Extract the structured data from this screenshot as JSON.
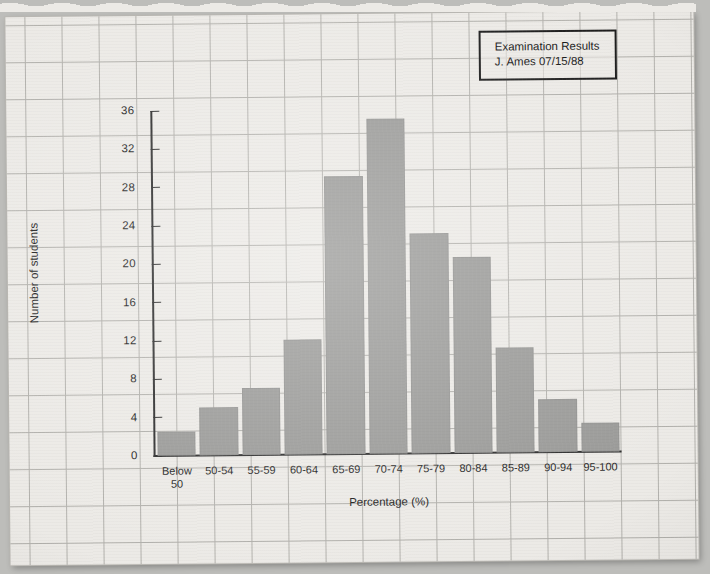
{
  "annotation": {
    "title": "Examination Results",
    "byline": "J. Ames 07/15/88"
  },
  "chart_data": {
    "type": "bar",
    "title": "Examination Results",
    "subtitle": "J. Ames 07/15/88",
    "xlabel": "Percentage (%)",
    "ylabel": "Number of students",
    "categories": [
      "Below 50",
      "50-54",
      "55-59",
      "60-64",
      "65-69",
      "70-74",
      "75-79",
      "80-84",
      "85-89",
      "90-94",
      "95-100"
    ],
    "values": [
      2.5,
      5,
      7,
      12,
      29,
      35,
      23,
      20.5,
      11,
      5.5,
      3
    ],
    "ylim": [
      0,
      36
    ],
    "ytick_step": 4,
    "yticks": [
      0,
      4,
      8,
      12,
      16,
      20,
      24,
      28,
      32,
      36
    ],
    "ytick_labels": [
      "0",
      "4",
      "8",
      "12",
      "16",
      "20",
      "24",
      "28",
      "32",
      "36"
    ],
    "grid": true,
    "legend": false,
    "bar_color": "#9a9a98",
    "axis_color": "#2b2b2b",
    "grid_color": "#8e8d88",
    "paper_color": "#eceae6"
  }
}
